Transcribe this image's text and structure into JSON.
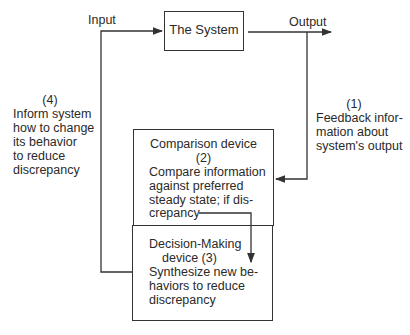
{
  "diagram": {
    "nodes": {
      "system": {
        "label": "The System"
      },
      "comparison": {
        "title": "Comparison device",
        "number": "(2)",
        "lines": [
          "Compare information",
          "against preferred",
          "steady state; if dis-",
          "crepancy"
        ]
      },
      "decision": {
        "title_line1": "Decision-Making",
        "title_line2": "device (3)",
        "lines": [
          "Synthesize new be-",
          "haviors to reduce",
          "discrepancy"
        ]
      }
    },
    "edges": {
      "input": {
        "label": "Input"
      },
      "output": {
        "label": "Output"
      }
    },
    "annotations": {
      "step1": {
        "number": "(1)",
        "lines": [
          "Feedback infor-",
          "mation about",
          "system's output"
        ]
      },
      "step4": {
        "number": "(4)",
        "lines": [
          "Inform system",
          "how to change",
          "its behavior",
          "to reduce",
          "discrepancy"
        ]
      }
    },
    "colors": {
      "line": "#333333",
      "text": "#2a2a2a",
      "background": "#ffffff"
    }
  }
}
